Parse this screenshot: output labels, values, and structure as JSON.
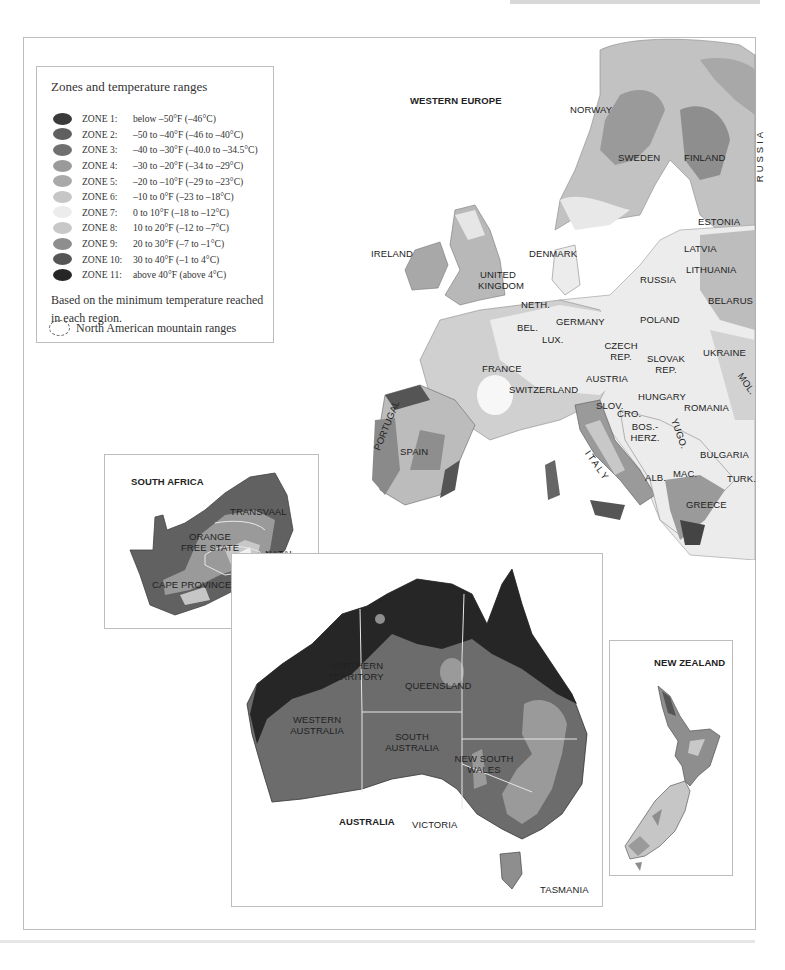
{
  "legend": {
    "title": "Zones and temperature ranges",
    "zones": [
      {
        "zone": "ZONE 1:",
        "range": "below –50°F (–46°C)",
        "color": "#3a3a3a"
      },
      {
        "zone": "ZONE 2:",
        "range": "–50 to –40°F (–46 to –40°C)",
        "color": "#5f5f5f"
      },
      {
        "zone": "ZONE 3:",
        "range": "–40 to –30°F (–40.0 to –34.5°C)",
        "color": "#707070"
      },
      {
        "zone": "ZONE 4:",
        "range": "–30 to –20°F (–34 to –29°C)",
        "color": "#9a9a9a"
      },
      {
        "zone": "ZONE 5:",
        "range": "–20 to –10°F (–29 to –23°C)",
        "color": "#a9a9a9"
      },
      {
        "zone": "ZONE 6:",
        "range": "–10 to 0°F (–23 to –18°C)",
        "color": "#c6c6c6"
      },
      {
        "zone": "ZONE 7:",
        "range": "0 to 10°F (–18 to –12°C)",
        "color": "#ececec"
      },
      {
        "zone": "ZONE 8:",
        "range": "10 to 20°F (–12 to –7°C)",
        "color": "#c8c8c8"
      },
      {
        "zone": "ZONE 9:",
        "range": "20 to 30°F (–7 to –1°C)",
        "color": "#8e8e8e"
      },
      {
        "zone": "ZONE 10:",
        "range": "30 to 40°F (–1 to 4°C)",
        "color": "#555555"
      },
      {
        "zone": "ZONE 11:",
        "range": "above 40°F (above 4°C)",
        "color": "#262626"
      }
    ],
    "note": "Based on the minimum temperature reached in each region.",
    "mountain_label": "North American mountain ranges"
  },
  "europe": {
    "title": "WESTERN EUROPE",
    "labels": [
      "NORWAY",
      "SWEDEN",
      "FINLAND",
      "RUSSIA",
      "ESTONIA",
      "LATVIA",
      "LITHUANIA",
      "BELARUS",
      "IRELAND",
      "UNITED KINGDOM",
      "DENMARK",
      "RUSSIA",
      "NETH.",
      "GERMANY",
      "POLAND",
      "BEL.",
      "LUX.",
      "CZECH REP.",
      "SLOVAK REP.",
      "UKRAINE",
      "FRANCE",
      "AUSTRIA",
      "SWITZERLAND",
      "HUNGARY",
      "MOL.",
      "SLOV.",
      "CRO.",
      "ROMANIA",
      "BOS.-HERZ.",
      "YUGO.",
      "PORTUGAL",
      "SPAIN",
      "ITALY",
      "BULGARIA",
      "ALB.",
      "MAC.",
      "TURK.",
      "GREECE"
    ]
  },
  "south_africa": {
    "title": "SOUTH AFRICA",
    "labels": [
      "TRANSVAAL",
      "ORANGE FREE STATE",
      "NATAL",
      "CAPE PROVINCE",
      "LESOTHO"
    ]
  },
  "australia": {
    "title": "AUSTRALIA",
    "labels": [
      "NORTHERN TERRITORY",
      "QUEENSLAND",
      "WESTERN AUSTRALIA",
      "SOUTH AUSTRALIA",
      "NEW SOUTH WALES",
      "VICTORIA",
      "TASMANIA"
    ]
  },
  "new_zealand": {
    "title": "NEW ZEALAND"
  }
}
